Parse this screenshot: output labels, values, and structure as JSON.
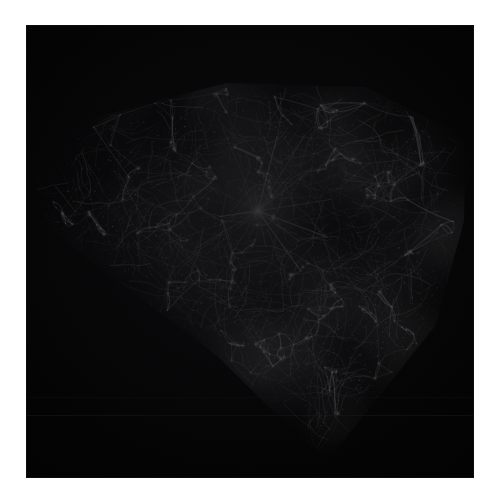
{
  "figure": {
    "kind": "volume-render",
    "background_color": "#ffffff",
    "panel_color": "#000000",
    "filament_color": "#e8e8ec",
    "glow_color": "#ffffff"
  },
  "panel": {
    "x": 26,
    "y": 25,
    "width": 448,
    "height": 453
  },
  "cube": {
    "projection": "corner-on perspective",
    "top_face_visible": true,
    "left_face_visible": true,
    "right_face_visible": true,
    "silhouette_points": "8,150 70,92 200,58 340,62 440,112 438,196 410,300 300,438 190,330 70,240 14,196",
    "apex_bottom": {
      "x": 272,
      "y": 438
    },
    "top_edge_y": 58,
    "left_extreme_x": 10,
    "right_extreme_x": 441
  },
  "features": {
    "central_cluster": {
      "x": 232,
      "y": 186,
      "label": "bright-halo-node"
    },
    "voids_visible": true,
    "filament_count_hint": 900,
    "halo_count_hint": 190
  },
  "artifacts": {
    "scanline_1_y": 390,
    "scanline_2_y": 372
  },
  "labels": {
    "alt_text": "Cosmic web dark matter simulation cube",
    "caption": ""
  }
}
